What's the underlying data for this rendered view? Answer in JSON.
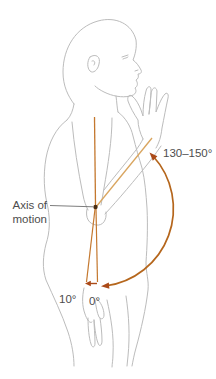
{
  "diagram": {
    "labels": {
      "axis_of_motion_line1": "Axis of",
      "axis_of_motion_line2": "motion",
      "flexion_range": "130–150°",
      "hyperextension_angle": "10°",
      "neutral_angle": "0°"
    },
    "colors": {
      "background": "#ffffff",
      "figure_outline": "#bcbcbc",
      "axis_line": "#c4782e",
      "forearm_line": "#d9a55f",
      "arc": "#b5661c",
      "arrow": "#ab4a18",
      "pointer_line": "#6e6e6e",
      "axis_dot": "#4a2c12",
      "label_text": "#4d4d4d"
    }
  }
}
